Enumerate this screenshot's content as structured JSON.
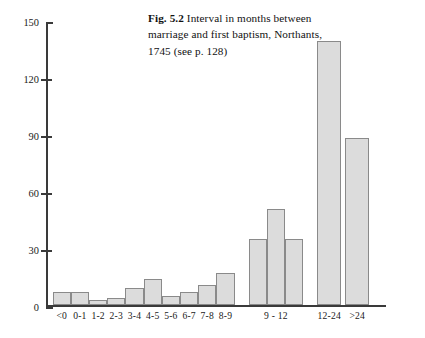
{
  "caption": {
    "fig_label": "Fig. 5.2",
    "text": " Interval in months between marriage and first baptism, Northants, 1745 (see p. 128)"
  },
  "colors": {
    "bar_fill": "#dcdcdc",
    "bar_border": "#8a8a8a",
    "axis": "#3a3a3a",
    "text": "#1a1a1a",
    "background": "#ffffff"
  },
  "chart_data": {
    "type": "bar",
    "title": "Fig. 5.2 Interval in months between marriage and first baptism, Northants, 1745 (see p. 128)",
    "xlabel": "",
    "ylabel": "",
    "ylim": [
      0,
      150
    ],
    "yticks": [
      0,
      30,
      60,
      90,
      120,
      150
    ],
    "grid": false,
    "legend": null,
    "categories": [
      "<0",
      "0-1",
      "1-2",
      "2-3",
      "3-4",
      "4-5",
      "5-6",
      "6-7",
      "7-8",
      "8-9",
      "9 - 12",
      "12-24",
      ">24"
    ],
    "values": [
      7,
      7,
      3,
      4,
      9,
      14,
      5,
      7,
      11,
      17,
      35,
      139,
      88
    ],
    "bars": [
      {
        "label": "<0",
        "value": 7,
        "group": "single"
      },
      {
        "label": "0-1",
        "value": 7,
        "group": "single"
      },
      {
        "label": "1-2",
        "value": 3,
        "group": "single"
      },
      {
        "label": "2-3",
        "value": 4,
        "group": "single"
      },
      {
        "label": "3-4",
        "value": 9,
        "group": "single"
      },
      {
        "label": "4-5",
        "value": 14,
        "group": "single"
      },
      {
        "label": "5-6",
        "value": 5,
        "group": "single"
      },
      {
        "label": "6-7",
        "value": 7,
        "group": "single"
      },
      {
        "label": "7-8",
        "value": 11,
        "group": "single"
      },
      {
        "label": "8-9",
        "value": 17,
        "group": "single"
      },
      {
        "label": "9 - 12",
        "value": 35,
        "group": "9-12"
      },
      {
        "label": "9 - 12",
        "value": 51,
        "group": "9-12"
      },
      {
        "label": "9 - 12",
        "value": 35,
        "group": "9-12"
      },
      {
        "label": "12-24",
        "value": 139,
        "group": "single"
      },
      {
        "label": ">24",
        "value": 88,
        "group": "single"
      }
    ],
    "note": "The bin '9 - 12' is drawn as three adjacent monthly bars sharing one axis label."
  },
  "yticks": [
    {
      "value": "150"
    },
    {
      "value": "120"
    },
    {
      "value": "90"
    },
    {
      "value": "60"
    },
    {
      "value": "30"
    },
    {
      "value": "0"
    }
  ],
  "xticklabels": [
    {
      "text": "<0"
    },
    {
      "text": "0-1"
    },
    {
      "text": "1-2"
    },
    {
      "text": "2-3"
    },
    {
      "text": "3-4"
    },
    {
      "text": "4-5"
    },
    {
      "text": "5-6"
    },
    {
      "text": "6-7"
    },
    {
      "text": "7-8"
    },
    {
      "text": "8-9"
    },
    {
      "text": "9 - 12"
    },
    {
      "text": "12-24"
    },
    {
      "text": ">24"
    }
  ]
}
